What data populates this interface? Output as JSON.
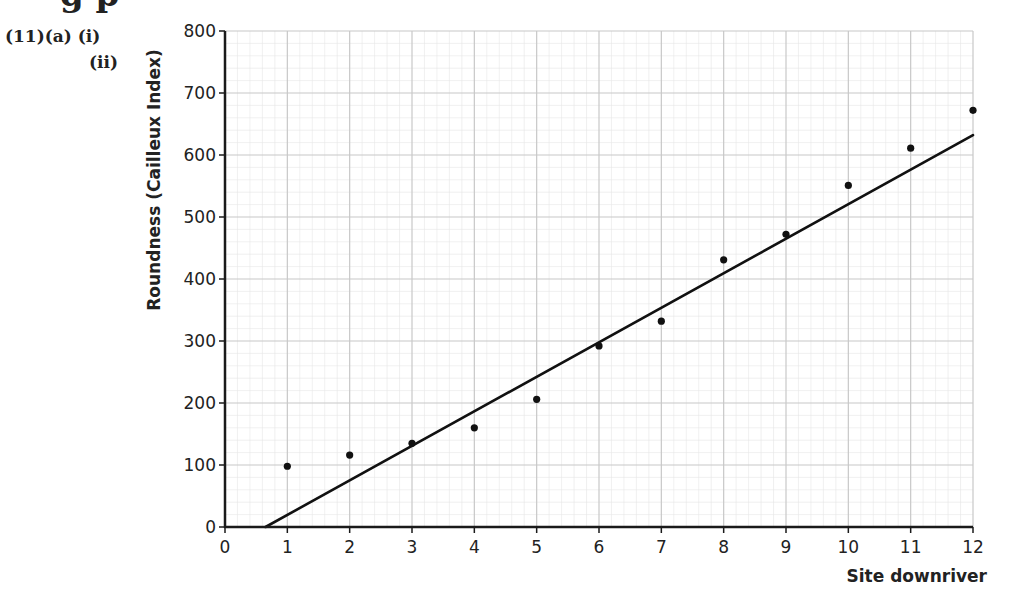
{
  "header": {
    "clipped_heading": "g p",
    "question_main": "(11)(a) (i)",
    "question_sub": "(ii)"
  },
  "chart_data": {
    "type": "scatter",
    "title": "",
    "xlabel": "Site downriver",
    "ylabel": "Roundness (Cailleux Index)",
    "xlim": [
      0,
      12
    ],
    "ylim": [
      0,
      800
    ],
    "x_ticks": [
      0,
      1,
      2,
      3,
      4,
      5,
      6,
      7,
      8,
      9,
      10,
      11,
      12
    ],
    "y_ticks": [
      0,
      100,
      200,
      300,
      400,
      500,
      600,
      700,
      800
    ],
    "grid": true,
    "grid_style": "graph paper (minor 0.2 x-units, 20 y-units)",
    "legend": null,
    "series": [
      {
        "name": "Roundness by site",
        "kind": "points",
        "x": [
          1,
          2,
          3,
          4,
          5,
          6,
          7,
          8,
          9,
          10,
          11,
          12
        ],
        "y": [
          98,
          116,
          135,
          160,
          206,
          292,
          332,
          431,
          472,
          551,
          611,
          672
        ]
      },
      {
        "name": "Line of best fit",
        "kind": "line",
        "x": [
          0.65,
          12
        ],
        "y": [
          0,
          632
        ]
      }
    ]
  },
  "colors": {
    "axis": "#1a1a1a",
    "grid_major": "#c8c8c8",
    "grid_minor": "#e6e6e6",
    "points": "#111111",
    "line": "#111111"
  }
}
